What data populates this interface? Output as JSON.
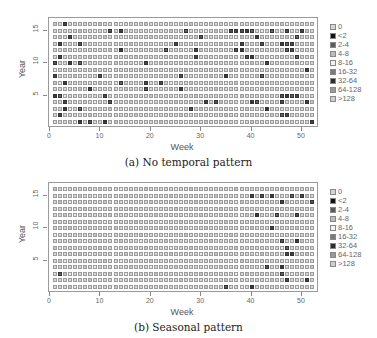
{
  "chart_data": [
    {
      "type": "heatmap",
      "title": "",
      "caption": "(a) No temporal pattern",
      "xlabel": "Week",
      "ylabel": "Year",
      "x_ticks": [
        0,
        10,
        20,
        30,
        40,
        50
      ],
      "y_ticks": [
        5,
        10,
        15
      ],
      "xlim": [
        0,
        52
      ],
      "ylim": [
        1,
        16
      ],
      "weeks": 52,
      "years": 16,
      "legend_position": "right",
      "grid": false,
      "legend": [
        "0",
        "<2",
        "2-4",
        "4-8",
        "8-16",
        "16-32",
        "32-64",
        "64-128",
        ">128"
      ],
      "highlight_cells": [
        [
          16,
          3
        ],
        [
          15,
          12
        ],
        [
          15,
          14
        ],
        [
          15,
          44
        ],
        [
          14,
          4
        ],
        [
          13,
          2
        ],
        [
          13,
          6
        ],
        [
          12,
          14
        ],
        [
          12,
          23
        ],
        [
          12,
          38
        ],
        [
          11,
          2
        ],
        [
          10,
          1
        ],
        [
          10,
          4
        ],
        [
          10,
          6
        ],
        [
          10,
          19
        ],
        [
          8,
          1
        ],
        [
          8,
          10
        ],
        [
          7,
          3
        ],
        [
          7,
          14
        ],
        [
          7,
          19
        ],
        [
          6,
          8
        ],
        [
          6,
          19
        ],
        [
          5,
          1
        ],
        [
          5,
          2
        ],
        [
          5,
          11
        ],
        [
          4,
          3
        ],
        [
          4,
          12
        ],
        [
          3,
          3
        ],
        [
          3,
          6
        ],
        [
          2,
          2
        ],
        [
          1,
          6
        ],
        [
          1,
          8
        ],
        [
          1,
          11
        ],
        [
          15,
          27
        ],
        [
          15,
          36
        ],
        [
          15,
          37
        ],
        [
          15,
          38
        ],
        [
          15,
          39
        ],
        [
          15,
          40
        ],
        [
          15,
          47
        ],
        [
          15,
          50
        ],
        [
          14,
          30
        ],
        [
          14,
          41
        ],
        [
          14,
          49
        ],
        [
          13,
          25
        ],
        [
          13,
          38
        ],
        [
          13,
          42
        ],
        [
          13,
          46
        ],
        [
          13,
          47
        ],
        [
          13,
          48
        ],
        [
          12,
          29
        ],
        [
          12,
          37
        ],
        [
          12,
          38
        ],
        [
          12,
          47
        ],
        [
          12,
          48
        ],
        [
          11,
          29
        ],
        [
          11,
          39
        ],
        [
          11,
          40
        ],
        [
          11,
          49
        ],
        [
          10,
          43
        ],
        [
          9,
          51
        ],
        [
          8,
          26
        ],
        [
          8,
          35
        ],
        [
          8,
          42
        ],
        [
          7,
          22
        ],
        [
          6,
          26
        ],
        [
          5,
          46
        ],
        [
          5,
          47
        ],
        [
          5,
          48
        ],
        [
          5,
          49
        ],
        [
          4,
          31
        ],
        [
          4,
          33
        ],
        [
          4,
          40
        ],
        [
          4,
          41
        ],
        [
          4,
          46
        ],
        [
          4,
          51
        ],
        [
          3,
          28
        ],
        [
          3,
          43
        ],
        [
          2,
          46
        ],
        [
          2,
          47
        ],
        [
          1,
          52
        ]
      ]
    },
    {
      "type": "heatmap",
      "title": "",
      "caption": "(b) Seasonal pattern",
      "xlabel": "Week",
      "ylabel": "Year",
      "x_ticks": [
        0,
        10,
        20,
        30,
        40,
        50
      ],
      "y_ticks": [
        5,
        10,
        15
      ],
      "xlim": [
        0,
        52
      ],
      "ylim": [
        1,
        16
      ],
      "weeks": 52,
      "years": 16,
      "legend_position": "right",
      "grid": false,
      "legend": [
        "0",
        "<2",
        "2-4",
        "4-8",
        "8-16",
        "16-32",
        "32-64",
        "64-128",
        ">128"
      ],
      "highlight_cells": [
        [
          15,
          40
        ],
        [
          15,
          42
        ],
        [
          15,
          44
        ],
        [
          15,
          48
        ],
        [
          15,
          50
        ],
        [
          14,
          46
        ],
        [
          14,
          52
        ],
        [
          12,
          41
        ],
        [
          12,
          45
        ],
        [
          12,
          49
        ],
        [
          10,
          44
        ],
        [
          8,
          46
        ],
        [
          8,
          49
        ],
        [
          7,
          47
        ],
        [
          6,
          47
        ],
        [
          6,
          48
        ],
        [
          4,
          43
        ],
        [
          4,
          46
        ],
        [
          3,
          46
        ],
        [
          2,
          47
        ],
        [
          2,
          51
        ],
        [
          1,
          35
        ],
        [
          1,
          40
        ],
        [
          3,
          2
        ]
      ]
    }
  ],
  "legend_colors": {
    "0": "#d6d6d6",
    "<2": "#111111",
    "2-4": "#5a5a5a",
    "4-8": "#bdbdbd",
    "8-16": "#f2f2f2",
    "16-32": "#7a7a7a",
    "32-64": "#2e2e2e",
    "64-128": "#9a9a9a",
    ">128": "#cfcfcf"
  },
  "panels": [
    {
      "caption": "(a) No temporal pattern",
      "xlabel": "Week",
      "ylabel": "Year"
    },
    {
      "caption": "(b) Seasonal pattern",
      "xlabel": "Week",
      "ylabel": "Year"
    }
  ],
  "legend": {
    "items": [
      "0",
      "<2",
      "2-4",
      "4-8",
      "8-16",
      "16-32",
      "32-64",
      "64-128",
      ">128"
    ]
  },
  "axis": {
    "x_ticks": [
      "0",
      "10",
      "20",
      "30",
      "40",
      "50"
    ],
    "y_ticks": [
      "5",
      "10",
      "15"
    ]
  }
}
